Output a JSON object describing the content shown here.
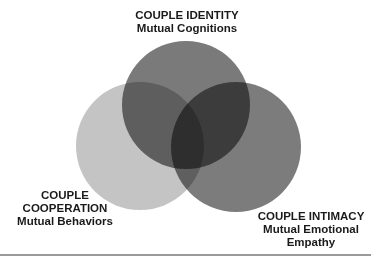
{
  "diagram": {
    "type": "venn",
    "sets": [
      {
        "id": "identity",
        "title": "COUPLE IDENTITY",
        "subtitle_lines": [
          "Mutual Cognitions"
        ],
        "color": "#6e6e6e",
        "position": "top"
      },
      {
        "id": "cooperation",
        "title_lines": [
          "COUPLE",
          "COOPERATION"
        ],
        "subtitle_lines": [
          "Mutual Behaviors"
        ],
        "color": "#c4c4c4",
        "position": "bottom-left"
      },
      {
        "id": "intimacy",
        "title": "COUPLE INTIMACY",
        "subtitle_lines": [
          "Mutual Emotional",
          "Empathy"
        ],
        "color": "#7c7c7c",
        "position": "bottom-right"
      }
    ],
    "labels": {
      "top": {
        "line1": "COUPLE IDENTITY",
        "line2": "Mutual Cognitions"
      },
      "left": {
        "line1": "COUPLE",
        "line2": "COOPERATION",
        "line3": "Mutual Behaviors"
      },
      "right": {
        "line1": "COUPLE INTIMACY",
        "line2": "Mutual Emotional",
        "line3": "Empathy"
      }
    },
    "colors": {
      "top_circle": "#6e6e6e",
      "left_circle": "#c4c4c4",
      "right_circle": "#7c7c7c",
      "center_overlap": "#3e3e3e",
      "text": "#1a1a1a",
      "rule": "#9a9a9a"
    }
  }
}
